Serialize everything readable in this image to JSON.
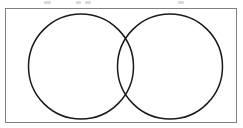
{
  "figure": {
    "kind": "venn-diagram",
    "title": "Two-circle Venn diagram",
    "caption": "",
    "background_color": "#ffffff",
    "frame": {
      "name": "bounding-box",
      "x": 5,
      "y": 8,
      "width": 232,
      "height": 115,
      "stroke_color": "#808080",
      "stroke_width": 1,
      "fill_color": "#ffffff"
    },
    "circles": [
      {
        "name": "left-circle",
        "label": "",
        "cx": 81,
        "cy": 66.5,
        "r": 52.5,
        "stroke_color": "#1a1a1a",
        "stroke_width": 1.5,
        "fill_color": "none"
      },
      {
        "name": "right-circle",
        "label": "",
        "cx": 170,
        "cy": 66.5,
        "r": 52.5,
        "stroke_color": "#1a1a1a",
        "stroke_width": 1.5,
        "fill_color": "none"
      }
    ],
    "intersection": {
      "name": "lens-region",
      "label": "",
      "upper_crossing": {
        "x": 124,
        "y": 32
      },
      "lower_crossing": {
        "x": 124,
        "y": 101
      },
      "fill_color": "none"
    },
    "region_labels": [],
    "scan_artifacts": [
      {
        "x": 44,
        "y": 1,
        "width": 7,
        "height": 3
      },
      {
        "x": 76,
        "y": 1,
        "width": 5,
        "height": 3
      },
      {
        "x": 85,
        "y": 1,
        "width": 6,
        "height": 3
      },
      {
        "x": 178,
        "y": 1,
        "width": 6,
        "height": 3
      }
    ]
  }
}
